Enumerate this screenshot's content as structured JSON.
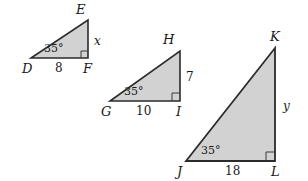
{
  "figure": {
    "fill_color": "#d2d2d2",
    "stroke_color": "#2b2b2b",
    "background_color": "#ffffff"
  },
  "triangles": [
    {
      "id": "DEF",
      "vertices": {
        "left": "D",
        "apex": "E",
        "right": "F"
      },
      "angle_label": "35°",
      "base_label": "8",
      "vertical_label": "x",
      "right_angle_at": "F"
    },
    {
      "id": "GHI",
      "vertices": {
        "left": "G",
        "apex": "H",
        "right": "I"
      },
      "angle_label": "35°",
      "base_label": "10",
      "vertical_label": "7",
      "right_angle_at": "I"
    },
    {
      "id": "JKL",
      "vertices": {
        "left": "J",
        "apex": "K",
        "right": "L"
      },
      "angle_label": "35°",
      "base_label": "18",
      "vertical_label": "y",
      "right_angle_at": "L"
    }
  ]
}
